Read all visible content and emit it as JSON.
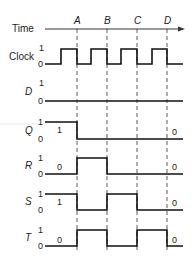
{
  "diagram": {
    "type": "timing-diagram",
    "time_axis": {
      "label": "Time",
      "markers": [
        {
          "label": "A",
          "x": 77
        },
        {
          "label": "B",
          "x": 107
        },
        {
          "label": "C",
          "x": 137
        },
        {
          "label": "D",
          "x": 167
        }
      ]
    },
    "signals": [
      {
        "name": "Clock",
        "high_label": "1",
        "low_label": "0",
        "annotation_start": "",
        "annotation_end": "",
        "points": "45,64 61,64 61,49 77,49 77,64 91,64 91,49 107,49 107,64 121,64 121,49 137,49 137,64 152,64 152,49 167,49 167,64 183,64"
      },
      {
        "name": "D",
        "high_label": "1",
        "low_label": "0",
        "annotation_start": "",
        "annotation_end": "",
        "points": "45,101 183,101"
      },
      {
        "name": "Q",
        "high_label": "1",
        "low_label": "0",
        "annotation_start": "1",
        "annotation_end": "0",
        "points": "45,122 77,122 77,139 183,139"
      },
      {
        "name": "R",
        "high_label": "1",
        "low_label": "0",
        "annotation_start": "0",
        "annotation_end": "0",
        "points": "45,174 77,174 77,158 107,158 107,174 183,174"
      },
      {
        "name": "S",
        "high_label": "1",
        "low_label": "0",
        "annotation_start": "1",
        "annotation_end": "0",
        "points": "45,194 77,194 77,210 107,210 107,194 137,194 137,210 183,210"
      },
      {
        "name": "T",
        "high_label": "1",
        "low_label": "0",
        "annotation_start": "0",
        "annotation_end": "0",
        "points": "45,246 77,246 77,230 107,230 107,246 137,246 137,230 167,230 167,246 183,246"
      }
    ]
  }
}
